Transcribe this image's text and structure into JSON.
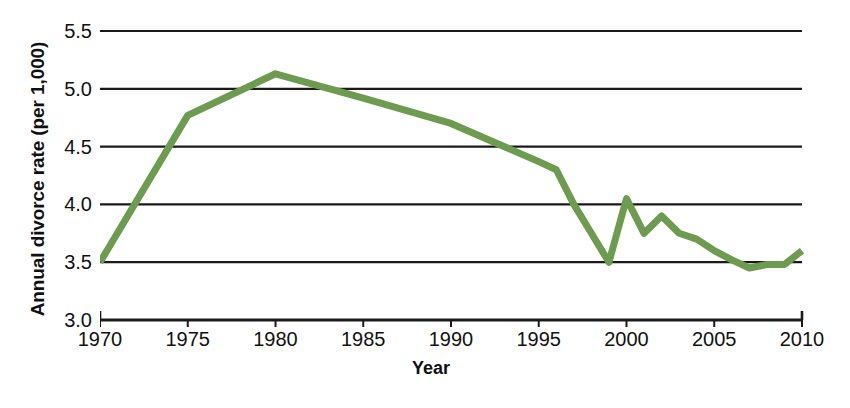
{
  "chart_data": {
    "type": "line",
    "title": "",
    "xlabel": "Year",
    "ylabel": "Annual divorce rate (per 1,000)",
    "xlim": [
      1970,
      2010
    ],
    "ylim": [
      3.0,
      5.5
    ],
    "grid": true,
    "legend_position": "none",
    "line_color": "#6d9b4f",
    "axis_color": "#1a1a1a",
    "xticks": [
      1970,
      1975,
      1980,
      1985,
      1990,
      1995,
      2000,
      2005,
      2010
    ],
    "xtick_labels": [
      "1970",
      "1975",
      "1980",
      "1985",
      "1990",
      "1995",
      "2000",
      "2005",
      "2010"
    ],
    "yticks": [
      3.0,
      3.5,
      4.0,
      4.5,
      5.0,
      5.5
    ],
    "ytick_labels": [
      "3.0",
      "3.5",
      "4.0",
      "4.5",
      "5.0",
      "5.5"
    ],
    "series": [
      {
        "name": "Annual divorce rate",
        "color": "#6d9b4f",
        "x": [
          1970,
          1975,
          1980,
          1985,
          1990,
          1995,
          1996,
          1997,
          1998,
          1999,
          2000,
          2001,
          2002,
          2003,
          2004,
          2005,
          2006,
          2007,
          2008,
          2009,
          2010
        ],
        "values": [
          3.5,
          4.77,
          5.13,
          4.92,
          4.7,
          4.37,
          4.3,
          4.0,
          3.75,
          3.5,
          4.05,
          3.75,
          3.9,
          3.75,
          3.7,
          3.6,
          3.52,
          3.45,
          3.48,
          3.48,
          3.6
        ]
      }
    ]
  },
  "axis": {
    "ylabel_text": "Annual divorce rate (per 1,000)",
    "xlabel_text": "Year"
  },
  "caption": {
    "text": ""
  }
}
